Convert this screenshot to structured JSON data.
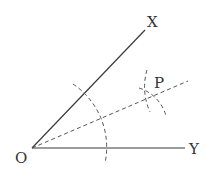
{
  "diagram": {
    "points": {
      "O": {
        "label": "O",
        "x": 32,
        "y": 148
      },
      "X": {
        "label": "X",
        "x": 145,
        "y": 30
      },
      "Y": {
        "label": "Y",
        "x": 185,
        "y": 148
      },
      "P": {
        "label": "P",
        "x": 152,
        "y": 95
      }
    },
    "labels": {
      "O": "O",
      "X": "X",
      "Y": "Y",
      "P": "P"
    },
    "rays": [
      {
        "name": "OX",
        "style": "solid"
      },
      {
        "name": "OY",
        "style": "solid"
      },
      {
        "name": "OP",
        "style": "dashed"
      }
    ],
    "arcs": [
      {
        "name": "arc-center-O",
        "style": "dashed"
      },
      {
        "name": "arc-near-P-1",
        "style": "dashed"
      },
      {
        "name": "arc-near-P-2",
        "style": "dashed"
      }
    ]
  }
}
